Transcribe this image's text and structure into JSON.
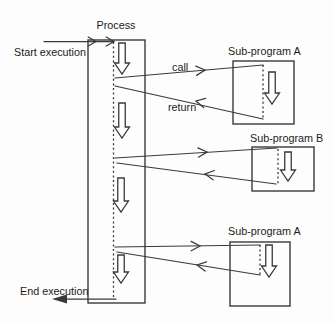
{
  "colors": {
    "paper": "#fdfdfd",
    "ink": "#3a3a3a",
    "text": "#1c1c1c"
  },
  "diagram": {
    "process_label": "Process",
    "start_label": "Start execution",
    "end_label": "End execution",
    "call_label": "call",
    "return_label": "return",
    "subprograms": [
      {
        "label": "Sub-program A"
      },
      {
        "label": "Sub-program B"
      },
      {
        "label": "Sub-program A"
      }
    ]
  }
}
